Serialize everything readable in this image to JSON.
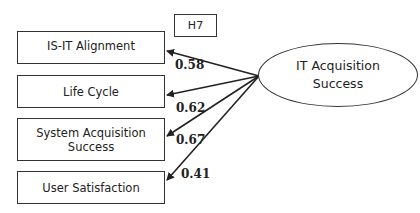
{
  "hypothesis_label": "H7",
  "latent": {
    "label": "IT Acquisition Success"
  },
  "indicators": [
    {
      "label": "IS-IT Alignment",
      "loading": "0.58"
    },
    {
      "label": "Life Cycle",
      "loading": "0.62"
    },
    {
      "label": "System Acquisition Success",
      "loading": "0.67"
    },
    {
      "label": "User Satisfaction",
      "loading": "0.41"
    }
  ]
}
